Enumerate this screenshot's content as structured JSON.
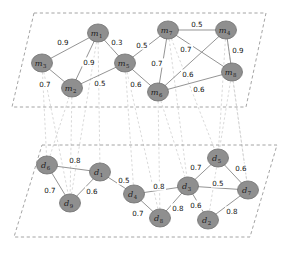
{
  "figure": {
    "node_fill": "#8f8f8f",
    "node_stroke": "#6f6f6f",
    "edge_color": "#8e8e8e",
    "plane_color": "#9a9a9a",
    "interlayer_color": "#cfcfcf"
  },
  "chart_data": {
    "type": "diagram",
    "subtype": "multilayer-network",
    "layers": [
      {
        "id": "top",
        "name": "m-layer",
        "plane": [
          [
            34,
            13
          ],
          [
            266,
            13
          ],
          [
            246,
            107
          ],
          [
            12,
            107
          ]
        ],
        "nodes": [
          {
            "id": "m1",
            "label": "m",
            "sub": "1",
            "x": 98,
            "y": 33
          },
          {
            "id": "m2",
            "label": "m",
            "sub": "2",
            "x": 72,
            "y": 88
          },
          {
            "id": "m3",
            "label": "m",
            "sub": "3",
            "x": 42,
            "y": 63
          },
          {
            "id": "m4",
            "label": "m",
            "sub": "4",
            "x": 226,
            "y": 30
          },
          {
            "id": "m5",
            "label": "m",
            "sub": "5",
            "x": 125,
            "y": 63
          },
          {
            "id": "m6",
            "label": "m",
            "sub": "6",
            "x": 158,
            "y": 92
          },
          {
            "id": "m7",
            "label": "m",
            "sub": "7",
            "x": 168,
            "y": 30
          },
          {
            "id": "m8",
            "label": "m",
            "sub": "8",
            "x": 232,
            "y": 72
          }
        ],
        "edges": [
          {
            "source": "m1",
            "target": "m3",
            "weight": "0.9",
            "lx": 63,
            "ly": 42
          },
          {
            "source": "m1",
            "target": "m5",
            "weight": "0.3",
            "lx": 117,
            "ly": 42
          },
          {
            "source": "m1",
            "target": "m2",
            "weight": "0.9",
            "lx": 89,
            "ly": 62
          },
          {
            "source": "m3",
            "target": "m2",
            "weight": "0.7",
            "lx": 45,
            "ly": 84
          },
          {
            "source": "m2",
            "target": "m5",
            "weight": "0.5",
            "lx": 100,
            "ly": 83
          },
          {
            "source": "m5",
            "target": "m7",
            "weight": "0.5",
            "lx": 142,
            "ly": 45
          },
          {
            "source": "m5",
            "target": "m6",
            "weight": "0.6",
            "lx": 136,
            "ly": 84
          },
          {
            "source": "m7",
            "target": "m4",
            "weight": "0.5",
            "lx": 197,
            "ly": 24
          },
          {
            "source": "m7",
            "target": "m6",
            "weight": "0.7",
            "lx": 157,
            "ly": 63
          },
          {
            "source": "m7",
            "target": "m8",
            "weight": "0.7",
            "lx": 186,
            "ly": 49
          },
          {
            "source": "m4",
            "target": "m8",
            "weight": "0.9",
            "lx": 238,
            "ly": 50
          },
          {
            "source": "m4",
            "target": "m6",
            "weight": "0.6",
            "lx": 188,
            "ly": 74
          },
          {
            "source": "m6",
            "target": "m8",
            "weight": "0.6",
            "lx": 199,
            "ly": 89
          }
        ]
      },
      {
        "id": "bottom",
        "name": "d-layer",
        "plane": [
          [
            42,
            145
          ],
          [
            277,
            145
          ],
          [
            250,
            237
          ],
          [
            14,
            237
          ]
        ],
        "nodes": [
          {
            "id": "d1",
            "label": "d",
            "sub": "1",
            "x": 100,
            "y": 172
          },
          {
            "id": "d2",
            "label": "d",
            "sub": "2",
            "x": 208,
            "y": 220
          },
          {
            "id": "d3",
            "label": "d",
            "sub": "3",
            "x": 188,
            "y": 186
          },
          {
            "id": "d4",
            "label": "d",
            "sub": "4",
            "x": 134,
            "y": 194
          },
          {
            "id": "d5",
            "label": "d",
            "sub": "5",
            "x": 218,
            "y": 158
          },
          {
            "id": "d6",
            "label": "d",
            "sub": "6",
            "x": 47,
            "y": 165
          },
          {
            "id": "d7",
            "label": "d",
            "sub": "7",
            "x": 248,
            "y": 190
          },
          {
            "id": "d8",
            "label": "d",
            "sub": "8",
            "x": 160,
            "y": 218
          },
          {
            "id": "d9",
            "label": "d",
            "sub": "9",
            "x": 70,
            "y": 203
          }
        ],
        "edges": [
          {
            "source": "d6",
            "target": "d1",
            "weight": "0.8",
            "lx": 75,
            "ly": 160
          },
          {
            "source": "d6",
            "target": "d9",
            "weight": "0.7",
            "lx": 50,
            "ly": 190
          },
          {
            "source": "d1",
            "target": "d9",
            "weight": "0.6",
            "lx": 92,
            "ly": 191
          },
          {
            "source": "d1",
            "target": "d4",
            "weight": "0.5",
            "lx": 124,
            "ly": 180
          },
          {
            "source": "d4",
            "target": "d3",
            "weight": "0.8",
            "lx": 159,
            "ly": 186
          },
          {
            "source": "d4",
            "target": "d8",
            "weight": "0.7",
            "lx": 138,
            "ly": 213
          },
          {
            "source": "d3",
            "target": "d8",
            "weight": "0.8",
            "lx": 178,
            "ly": 208
          },
          {
            "source": "d3",
            "target": "d5",
            "weight": "0.7",
            "lx": 196,
            "ly": 167
          },
          {
            "source": "d3",
            "target": "d7",
            "weight": "0.5",
            "lx": 218,
            "ly": 183
          },
          {
            "source": "d3",
            "target": "d2",
            "weight": "0.6",
            "lx": 196,
            "ly": 205
          },
          {
            "source": "d5",
            "target": "d7",
            "weight": "0.6",
            "lx": 241,
            "ly": 168
          },
          {
            "source": "d2",
            "target": "d7",
            "weight": "0.8",
            "lx": 232,
            "ly": 211
          }
        ]
      }
    ],
    "interlayer_links": [
      {
        "source": "m1",
        "target": "d1"
      },
      {
        "source": "m2",
        "target": "d9"
      },
      {
        "source": "m3",
        "target": "d6"
      },
      {
        "source": "m4",
        "target": "d7"
      },
      {
        "source": "m5",
        "target": "d4"
      },
      {
        "source": "m6",
        "target": "d8"
      },
      {
        "source": "m7",
        "target": "d5"
      },
      {
        "source": "m8",
        "target": "d2"
      },
      {
        "source": "m1",
        "target": "d9"
      },
      {
        "source": "m2",
        "target": "d6"
      },
      {
        "source": "m5",
        "target": "d8"
      },
      {
        "source": "m7",
        "target": "d3"
      },
      {
        "source": "m8",
        "target": "d7"
      },
      {
        "source": "m4",
        "target": "d5"
      },
      {
        "source": "m6",
        "target": "d3"
      },
      {
        "source": "m3",
        "target": "d9"
      }
    ]
  }
}
